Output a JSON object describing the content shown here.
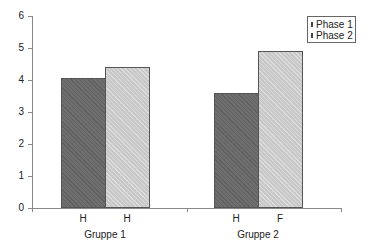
{
  "chart_data": {
    "type": "bar",
    "title": "",
    "xlabel": "",
    "ylabel": "",
    "ylim": [
      0,
      6
    ],
    "yticks": [
      "0",
      "1",
      "2",
      "3",
      "4",
      "5",
      "6"
    ],
    "grid": false,
    "legend_position": "top-right",
    "categories": [
      "Gruppe 1",
      "Gruppe 2"
    ],
    "bar_labels": [
      [
        "H",
        "H"
      ],
      [
        "H",
        "F"
      ]
    ],
    "series": [
      {
        "name": "Phase 1",
        "values": [
          4.05,
          3.6
        ],
        "color": "#6e6e6e"
      },
      {
        "name": "Phase 2",
        "values": [
          4.4,
          4.9
        ],
        "color": "#c8c8c8"
      }
    ]
  }
}
